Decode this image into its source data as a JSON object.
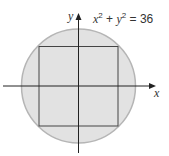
{
  "diagram": {
    "equation": {
      "x": "x",
      "exp1": "2",
      "plus": " + ",
      "y": "y",
      "exp2": "2",
      "equals": " = 36"
    },
    "axes": {
      "x_label": "x",
      "y_label": "y"
    },
    "circle": {
      "equation": "x^2 + y^2 = 36",
      "radius": 6,
      "fill": "#e2e2e2",
      "stroke": "#b5b5b5"
    },
    "square": {
      "inscribed": true,
      "stroke": "#444444"
    }
  }
}
